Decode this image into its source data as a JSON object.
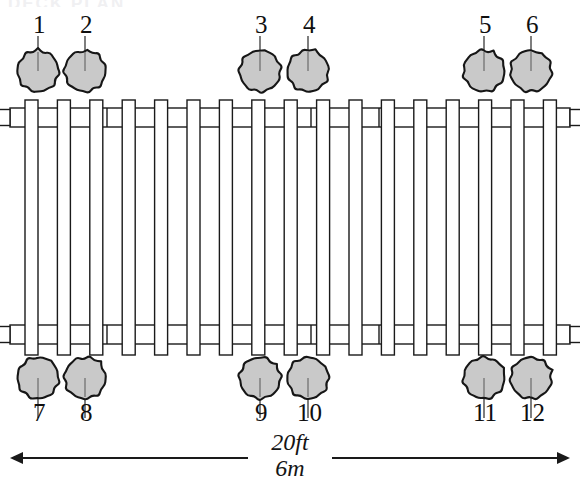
{
  "diagram": {
    "colors": {
      "stroke": "#1a1a1a",
      "beam_fill": "#ffffff",
      "tree_fill": "#c9c9c9",
      "tree_stroke": "#161616",
      "leader": "#3a3a3a",
      "background": "#ffffff"
    },
    "cropped_header_text": "DECK PLAN"
  },
  "markers": {
    "top": [
      {
        "id": "1",
        "label": "1",
        "cx": 38,
        "cy": 71,
        "r": 22,
        "label_x": 33,
        "label_y": 12,
        "leader_top": 36
      },
      {
        "id": "2",
        "label": "2",
        "cx": 85,
        "cy": 71,
        "r": 22,
        "label_x": 80,
        "label_y": 12,
        "leader_top": 36
      },
      {
        "id": "3",
        "label": "3",
        "cx": 260,
        "cy": 71,
        "r": 22,
        "label_x": 255,
        "label_y": 12,
        "leader_top": 36
      },
      {
        "id": "4",
        "label": "4",
        "cx": 308,
        "cy": 71,
        "r": 22,
        "label_x": 303,
        "label_y": 12,
        "leader_top": 36
      },
      {
        "id": "5",
        "label": "5",
        "cx": 484,
        "cy": 71,
        "r": 22,
        "label_x": 479,
        "label_y": 12,
        "leader_top": 36
      },
      {
        "id": "6",
        "label": "6",
        "cx": 531,
        "cy": 71,
        "r": 22,
        "label_x": 526,
        "label_y": 12,
        "leader_top": 36
      }
    ],
    "bottom": [
      {
        "id": "7",
        "label": "7",
        "cx": 38,
        "cy": 378,
        "r": 22,
        "label_x": 33,
        "label_y": 400,
        "leader_bottom": 418
      },
      {
        "id": "8",
        "label": "8",
        "cx": 85,
        "cy": 378,
        "r": 22,
        "label_x": 80,
        "label_y": 400,
        "leader_bottom": 418
      },
      {
        "id": "9",
        "label": "9",
        "cx": 260,
        "cy": 378,
        "r": 22,
        "label_x": 255,
        "label_y": 400,
        "leader_bottom": 418
      },
      {
        "id": "10",
        "label": "10",
        "cx": 308,
        "cy": 378,
        "r": 22,
        "label_x": 297,
        "label_y": 400,
        "leader_bottom": 418
      },
      {
        "id": "11",
        "label": "11",
        "cx": 484,
        "cy": 378,
        "r": 22,
        "label_x": 473,
        "label_y": 400,
        "leader_bottom": 418
      },
      {
        "id": "12",
        "label": "12",
        "cx": 531,
        "cy": 378,
        "r": 22,
        "label_x": 520,
        "label_y": 400,
        "leader_bottom": 418
      }
    ]
  },
  "dimension": {
    "primary": "20ft",
    "secondary": "6m",
    "line_y": 458,
    "x_start": 10,
    "x_end": 570,
    "gap_start": 248,
    "gap_end": 332,
    "arrow_size": 13
  },
  "structure": {
    "joist_count": 17,
    "joist_x_start": 25,
    "joist_spacing": 32.4,
    "joist_width": 13,
    "joist_top": 100,
    "joist_bottom": 355,
    "rail_top_y": 108,
    "rail_bottom_y": 325,
    "rail_thickness": 19,
    "rail_x_start": 10,
    "rail_x_end": 570,
    "end_tab_width": 11,
    "end_tab_height": 16,
    "rail_break_x": [
      107,
      311,
      379
    ],
    "note": "Vertical joists crossed by two horizontal beam rails, plan view"
  }
}
